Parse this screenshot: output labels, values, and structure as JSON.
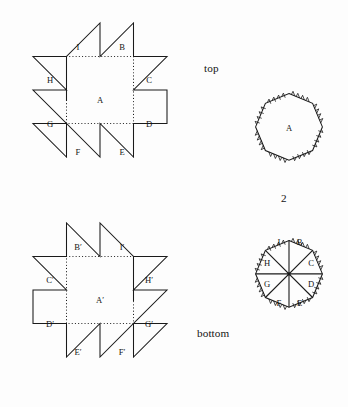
{
  "figure": {
    "number": "2",
    "background_color": "#fdfdfd",
    "ink_color": "#1a1a1a"
  },
  "captions": {
    "top": "top",
    "bottom": "bottom"
  },
  "panels": {
    "top_left_star": {
      "center_label": "A",
      "point_labels": [
        "I",
        "B",
        "C",
        "D",
        "E",
        "F",
        "G",
        "H"
      ],
      "label_positions": [
        {
          "label": "I",
          "x": 78,
          "y": 48
        },
        {
          "label": "B",
          "x": 122,
          "y": 48
        },
        {
          "label": "C",
          "x": 149,
          "y": 81
        },
        {
          "label": "D",
          "x": 149,
          "y": 125
        },
        {
          "label": "E",
          "x": 122,
          "y": 153
        },
        {
          "label": "F",
          "x": 78,
          "y": 153
        },
        {
          "label": "G",
          "x": 50,
          "y": 125
        },
        {
          "label": "H",
          "x": 50,
          "y": 81
        }
      ],
      "center_label_position": {
        "x": 100,
        "y": 101
      }
    },
    "top_right_octagon": {
      "center_label": "A",
      "center_label_position": {
        "x": 289,
        "y": 129
      }
    },
    "bottom_left_star": {
      "center_label": "A′",
      "point_labels": [
        "B′",
        "I′",
        "H′",
        "G′",
        "F′",
        "E′",
        "D′",
        "C′"
      ],
      "label_positions": [
        {
          "label": "B′",
          "x": 78,
          "y": 248
        },
        {
          "label": "I′",
          "x": 122,
          "y": 248
        },
        {
          "label": "H′",
          "x": 149,
          "y": 281
        },
        {
          "label": "G′",
          "x": 149,
          "y": 325
        },
        {
          "label": "F′",
          "x": 122,
          "y": 353
        },
        {
          "label": "E′",
          "x": 78,
          "y": 353
        },
        {
          "label": "D′",
          "x": 50,
          "y": 325
        },
        {
          "label": "C′",
          "x": 50,
          "y": 281
        }
      ],
      "center_label_position": {
        "x": 100,
        "y": 301
      }
    },
    "bottom_right_octagon": {
      "sector_labels": [
        "I",
        "B",
        "C",
        "D",
        "E",
        "F",
        "G",
        "H"
      ],
      "label_positions": [
        {
          "label": "I",
          "x": 279,
          "y": 243
        },
        {
          "label": "B",
          "x": 299,
          "y": 243
        },
        {
          "label": "C",
          "x": 311,
          "y": 264
        },
        {
          "label": "D",
          "x": 311,
          "y": 289
        },
        {
          "label": "E",
          "x": 299,
          "y": 306
        },
        {
          "label": "F",
          "x": 279,
          "y": 306
        },
        {
          "label": "G",
          "x": 267,
          "y": 289
        },
        {
          "label": "H",
          "x": 267,
          "y": 264
        }
      ]
    }
  }
}
